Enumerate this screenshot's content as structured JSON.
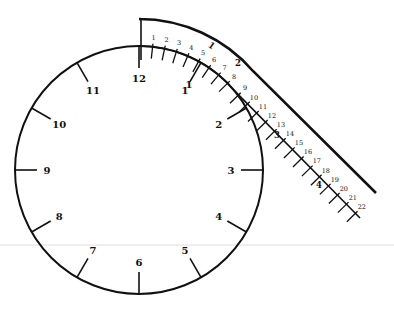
{
  "diagram": {
    "type": "clock-with-tape-measure",
    "colors": {
      "stroke": "#111111",
      "background": "#ffffff",
      "guide_line": "#cfcfcf"
    },
    "clock": {
      "center": [
        139,
        170
      ],
      "radius": 124,
      "hour_labels": [
        "12",
        "1",
        "2",
        "3",
        "4",
        "5",
        "6",
        "7",
        "8",
        "9",
        "10",
        "11"
      ]
    },
    "tape": {
      "fine_labels": [
        "1",
        "2",
        "3",
        "4",
        "5",
        "6",
        "7",
        "8",
        "9",
        "10",
        "11",
        "12",
        "13",
        "14",
        "15",
        "16",
        "17",
        "18",
        "19",
        "20",
        "21",
        "22"
      ],
      "coarse_labels": [
        "1",
        "2",
        "3",
        "4"
      ]
    }
  }
}
